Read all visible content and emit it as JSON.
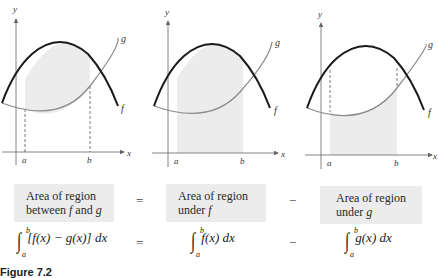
{
  "figure": {
    "caption": "Figure 7.2",
    "axis_labels": {
      "x": "x",
      "y": "y"
    },
    "tick_labels": {
      "a": "a",
      "b": "b"
    },
    "curve_labels": {
      "f": "f",
      "g": "g"
    },
    "colors": {
      "f_curve": "#1a1a1a",
      "g_curve": "#8c8c8c",
      "shading": "#ececec",
      "box_bg": "#ececec",
      "axis": "#666666"
    },
    "panels": [
      {
        "id": "between",
        "shaded_region": "between f and g from a to b"
      },
      {
        "id": "under_f",
        "shaded_region": "under f from a to b"
      },
      {
        "id": "under_g",
        "shaded_region": "under g from a to b"
      }
    ]
  },
  "boxes": {
    "left": {
      "line1": "Area of region",
      "line2_prefix": "between ",
      "line2_f": "f",
      "line2_mid": " and ",
      "line2_g": "g"
    },
    "middle": {
      "line1": "Area of region",
      "line2_prefix": "under ",
      "line2_var": "f"
    },
    "right": {
      "line1": "Area of region",
      "line2_prefix": "under ",
      "line2_var": "g"
    }
  },
  "operators": {
    "equals": "=",
    "minus": "−"
  },
  "integrals": {
    "lower": "a",
    "upper": "b",
    "left": "[f(x) − g(x)] dx",
    "middle": "f(x) dx",
    "right": "g(x) dx",
    "sign": "∫"
  }
}
